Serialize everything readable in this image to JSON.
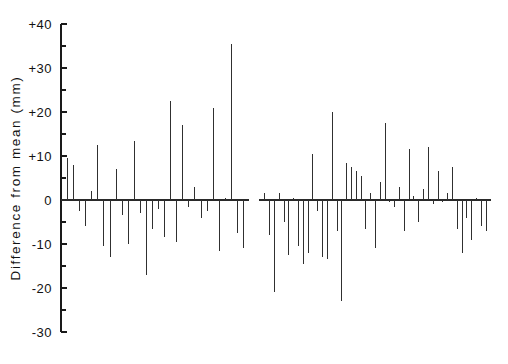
{
  "chart_data": {
    "type": "bar",
    "title": "",
    "subtitle": "",
    "xlabel": "",
    "ylabel": "Difference  from  mean  (mm)",
    "ylim": [
      -30,
      40
    ],
    "ytick_labels": [
      "+40",
      "+30",
      "+20",
      "+10",
      "0",
      "-10",
      "-20",
      "-30"
    ],
    "ytick_values": [
      40,
      30,
      20,
      10,
      0,
      -10,
      -20,
      -30
    ],
    "minor_tick_values": [
      35,
      25,
      15,
      5,
      -5,
      -15,
      -25
    ],
    "grid": false,
    "legend": null,
    "x_axis_visible": false,
    "baseline_value": 0,
    "units": "mm",
    "series": [
      {
        "name": "group-1",
        "values": [
          9.5,
          8.0,
          -2.5,
          -6.0,
          2.0,
          12.5,
          -10.5,
          -13.0,
          7.0,
          -3.5,
          -10.0,
          13.5,
          -3.0,
          -17.0,
          -6.5,
          -2.0,
          -8.5,
          22.5,
          -9.5,
          17.0,
          -1.5,
          3.0,
          -4.0,
          -2.5,
          21.0,
          -11.5,
          0.5,
          35.5,
          -7.5,
          -11.0
        ]
      },
      {
        "name": "group-2",
        "values": [
          1.5,
          -8.0,
          -21.0,
          1.5,
          -5.0,
          -12.5,
          0.5,
          -10.5,
          -14.5,
          -12.0,
          10.5,
          -2.5,
          -13.0,
          -13.5,
          20.0,
          -7.0,
          -23.0,
          8.5,
          7.5,
          6.5,
          5.5,
          -6.5,
          1.5,
          -11.0,
          4.0,
          17.5,
          -0.5,
          -1.5,
          3.0,
          -7.0,
          11.5,
          1.0,
          -5.0,
          2.5,
          12.0,
          -1.0,
          6.5,
          -0.5,
          1.5,
          7.5,
          -6.5,
          -12.0,
          -4.0,
          -9.0,
          0.5,
          -6.0,
          -7.0
        ]
      }
    ],
    "group_layout": {
      "group_1_x_start_px": 64,
      "group_1_x_end_px": 246,
      "group_2_x_start_px": 262,
      "group_2_x_end_px": 488
    }
  }
}
